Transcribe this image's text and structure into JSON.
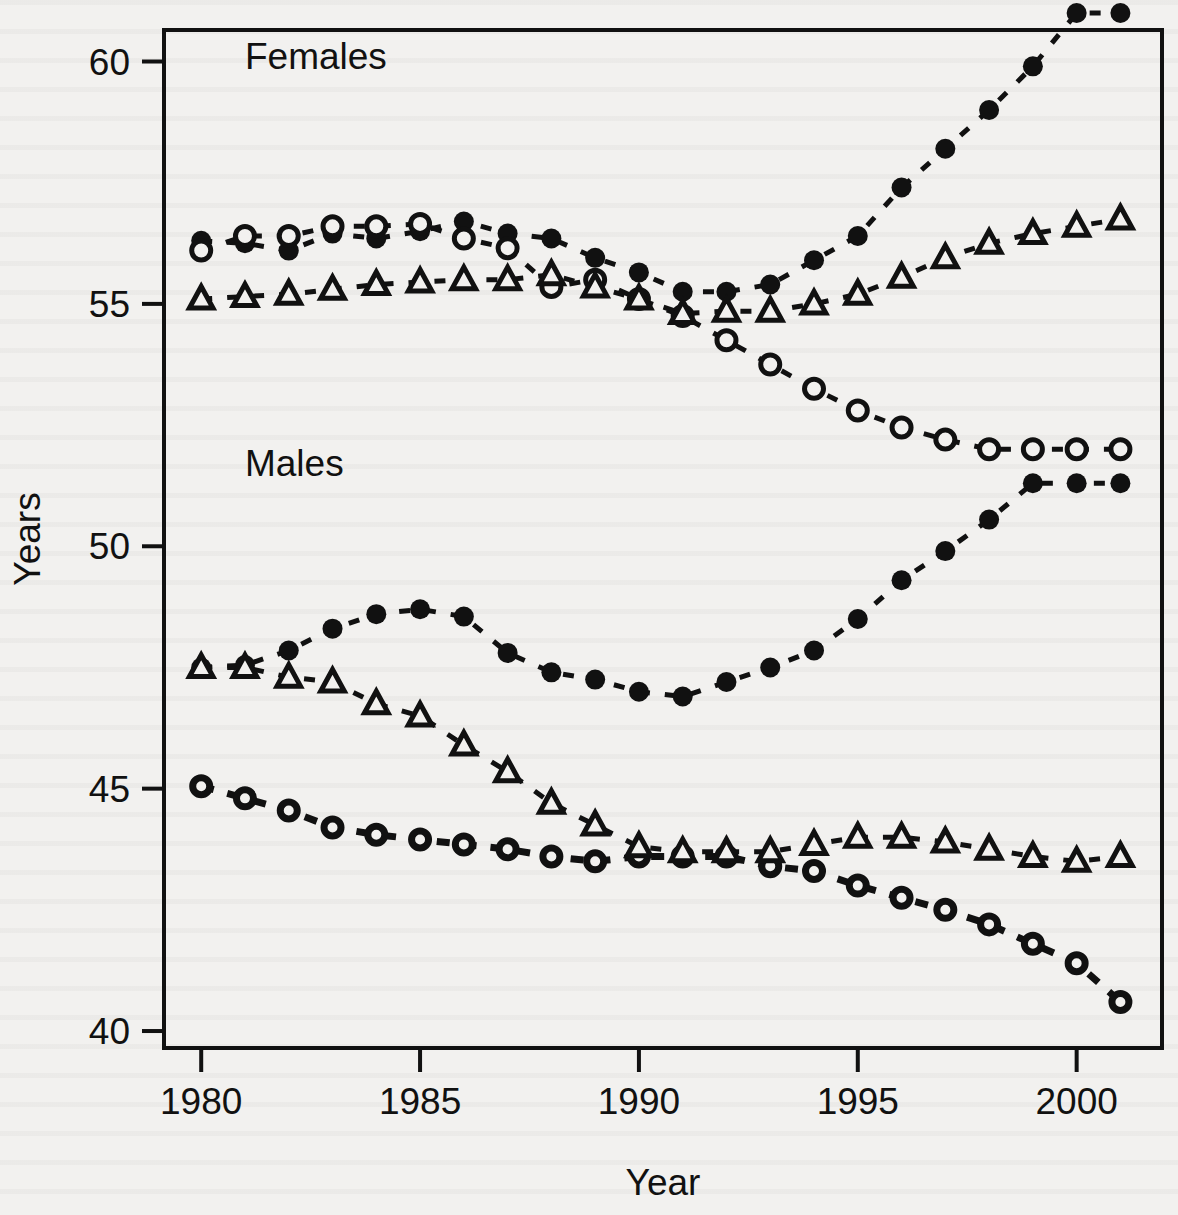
{
  "figure": {
    "background_color": "#f2f1ef",
    "ink_color": "#111111",
    "panel_labels": [
      {
        "name": "females-label",
        "text": "Females",
        "x": 1981.0,
        "y": 59.85
      },
      {
        "name": "males-label",
        "text": "Males",
        "x": 1981.0,
        "y": 51.45
      }
    ]
  },
  "chart_data": {
    "type": "line",
    "title": "",
    "xlabel": "Year",
    "ylabel": "Years",
    "xlim": [
      1979.15,
      2001.95
    ],
    "ylim": [
      39.65,
      60.65
    ],
    "xticks": [
      1980,
      1985,
      1990,
      1995,
      2000
    ],
    "xtick_labels": [
      "1980",
      "1985",
      "1990",
      "1995",
      "2000"
    ],
    "yticks": [
      40,
      45,
      50,
      55,
      60
    ],
    "ytick_labels": [
      "40",
      "45",
      "50",
      "55",
      "60"
    ],
    "grid": false,
    "legend": "none",
    "line_style": "dashed",
    "x": [
      1980,
      1981,
      1982,
      1983,
      1984,
      1985,
      1986,
      1987,
      1988,
      1989,
      1990,
      1991,
      1992,
      1993,
      1994,
      1995,
      1996,
      1997,
      1998,
      1999,
      2000,
      2001
    ],
    "series": [
      {
        "name": "Females - filled circle",
        "group": "Females",
        "marker": "filled-circle",
        "values": [
          56.3,
          56.25,
          56.1,
          56.45,
          56.35,
          56.5,
          56.7,
          56.45,
          56.35,
          55.95,
          55.65,
          55.25,
          55.25,
          55.4,
          55.9,
          56.4,
          57.4,
          58.2,
          59.0,
          59.9,
          61.0,
          61.0
        ]
      },
      {
        "name": "Females - open circle",
        "group": "Females",
        "marker": "open-circle",
        "values": [
          56.1,
          56.4,
          56.4,
          56.6,
          56.6,
          56.65,
          56.35,
          56.15,
          55.35,
          55.5,
          55.1,
          54.75,
          54.25,
          53.75,
          53.25,
          52.8,
          52.45,
          52.2,
          52.0,
          52.0,
          52.0,
          52.0
        ]
      },
      {
        "name": "Females - triangle",
        "group": "Females",
        "marker": "open-triangle",
        "values": [
          55.1,
          55.15,
          55.2,
          55.3,
          55.4,
          55.45,
          55.5,
          55.5,
          55.6,
          55.35,
          55.1,
          54.8,
          54.85,
          54.85,
          55.0,
          55.2,
          55.55,
          55.95,
          56.25,
          56.45,
          56.6,
          56.75
        ]
      },
      {
        "name": "Males - filled circle",
        "group": "Males",
        "marker": "filled-circle",
        "values": [
          47.5,
          47.55,
          47.85,
          48.3,
          48.6,
          48.7,
          48.55,
          47.8,
          47.4,
          47.25,
          47.0,
          46.9,
          47.2,
          47.5,
          47.85,
          48.5,
          49.3,
          49.9,
          50.55,
          51.3,
          51.3,
          51.3
        ]
      },
      {
        "name": "Males - open circle",
        "group": "Males",
        "marker": "open-circle",
        "values": [
          45.05,
          44.8,
          44.55,
          44.2,
          44.05,
          43.95,
          43.85,
          43.75,
          43.6,
          43.5,
          43.6,
          43.6,
          43.6,
          43.4,
          43.3,
          43.0,
          42.75,
          42.5,
          42.2,
          41.8,
          41.4,
          40.6
        ]
      },
      {
        "name": "Males - triangle",
        "group": "Males",
        "marker": "open-triangle",
        "values": [
          47.5,
          47.5,
          47.3,
          47.2,
          46.75,
          46.5,
          45.9,
          45.35,
          44.7,
          44.25,
          43.8,
          43.7,
          43.7,
          43.7,
          43.85,
          44.0,
          44.0,
          43.9,
          43.75,
          43.6,
          43.5,
          43.6
        ]
      }
    ]
  }
}
